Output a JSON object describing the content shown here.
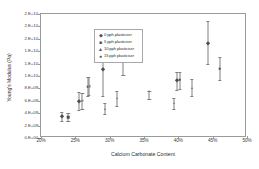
{
  "chart_data": {
    "type": "scatter",
    "title": "",
    "xlabel": "Calcium Carbonate Content",
    "ylabel": "Young's Modulus (Pa)",
    "xlim": [
      20,
      50
    ],
    "ylim": [
      0,
      20000000000
    ],
    "xticks": [
      "20%",
      "25%",
      "30%",
      "35%",
      "40%",
      "45%",
      "50%"
    ],
    "xtick_values": [
      20,
      25,
      30,
      35,
      40,
      45,
      50
    ],
    "yticks": [
      "0.E+00",
      "2.E+09",
      "4.E+09",
      "6.E+09",
      "8.E+09",
      "1.E+10",
      "1.E+10",
      "1.E+10",
      "2.E+10",
      "2.E+10",
      "2.E+10"
    ],
    "ytick_values": [
      0,
      2000000000,
      4000000000,
      6000000000,
      8000000000,
      10000000000,
      12000000000,
      14000000000,
      16000000000,
      18000000000,
      20000000000
    ],
    "grid": false,
    "legend_position": "top-left",
    "errorbars": true,
    "series": [
      {
        "name": "0 pph plasticiser",
        "marker": "diamond",
        "points": [
          {
            "x": 23.0,
            "y": 3500000000,
            "err_low": 700000000,
            "err_high": 700000000
          },
          {
            "x": 25.5,
            "y": 5900000000,
            "err_low": 1400000000,
            "err_high": 1500000000
          },
          {
            "x": 29.0,
            "y": 11100000000,
            "err_low": 4300000000,
            "err_high": 4500000000
          },
          {
            "x": 39.8,
            "y": 9300000000,
            "err_low": 1600000000,
            "err_high": 1400000000
          },
          {
            "x": 44.3,
            "y": 15400000000,
            "err_low": 3500000000,
            "err_high": 3400000000
          }
        ]
      },
      {
        "name": "5 pph plasticiser",
        "marker": "square",
        "points": [
          {
            "x": 24.0,
            "y": 3400000000,
            "err_low": 700000000,
            "err_high": 700000000
          },
          {
            "x": 26.8,
            "y": 8300000000,
            "err_low": 1500000000,
            "err_high": 1600000000
          },
          {
            "x": 32.0,
            "y": 13600000000,
            "err_low": 3400000000,
            "err_high": 3600000000
          },
          {
            "x": 40.2,
            "y": 9400000000,
            "err_low": 1500000000,
            "err_high": 1300000000
          },
          {
            "x": 46.0,
            "y": 11200000000,
            "err_low": 1800000000,
            "err_high": 1800000000
          }
        ]
      },
      {
        "name": "10 pph plasticiser",
        "marker": "triangle",
        "points": [
          {
            "x": 29.3,
            "y": 4700000000,
            "err_low": 900000000,
            "err_high": 1000000000
          },
          {
            "x": 31.0,
            "y": 6500000000,
            "err_low": 1300000000,
            "err_high": 1100000000
          },
          {
            "x": 35.8,
            "y": 7600000000,
            "err_low": 1300000000,
            "err_high": 0
          },
          {
            "x": 39.3,
            "y": 5600000000,
            "err_low": 1000000000,
            "err_high": 800000000
          },
          {
            "x": 42.0,
            "y": 8100000000,
            "err_low": 1300000000,
            "err_high": 1400000000
          }
        ]
      },
      {
        "name": "15 pph plasticiser",
        "marker": "circle",
        "points": [
          {
            "x": 26.0,
            "y": 6000000000,
            "err_low": 1300000000,
            "err_high": 1300000000
          },
          {
            "x": 27.0,
            "y": 8400000000,
            "err_low": 1400000000,
            "err_high": 1500000000
          }
        ]
      }
    ]
  },
  "legend": {
    "items": [
      {
        "label": "0 pph plasticiser",
        "key": "◆"
      },
      {
        "label": "5 pph plasticiser",
        "key": "■"
      },
      {
        "label": "10 pph plasticiser",
        "key": "▲"
      },
      {
        "label": "15 pph plasticiser",
        "key": "●"
      }
    ]
  }
}
